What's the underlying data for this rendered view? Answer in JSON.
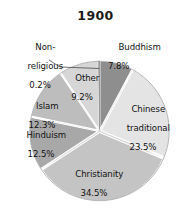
{
  "chart_data": {
    "type": "pie",
    "title": "1900",
    "subtitle": "",
    "xlabel": "",
    "ylabel": "",
    "grid": false,
    "legend_position": "none",
    "units": "percent",
    "value_suffix": "%",
    "categories": [
      "Buddhism",
      "Chinese traditional",
      "Christianity",
      "Hinduism",
      "Islam",
      "Other",
      "Non-religious"
    ],
    "values": [
      7.8,
      23.5,
      34.5,
      12.5,
      12.3,
      9.2,
      0.2
    ],
    "slices": [
      {
        "label": "Buddhism",
        "value": 7.8,
        "value_text": "7.8%",
        "color": "#8e8e8e",
        "start_deg": 0,
        "end_deg": 28.08,
        "label_placement": "outside-right"
      },
      {
        "label": "Chinese\ntraditional",
        "label_line1": "Chinese",
        "label_line2": "traditional",
        "value": 23.5,
        "value_text": "23.5%",
        "color": "#e4e4e4",
        "start_deg": 28.08,
        "end_deg": 112.68,
        "label_placement": "inside"
      },
      {
        "label": "Christianity",
        "value": 34.5,
        "value_text": "34.5%",
        "color": "#c4c4c4",
        "start_deg": 112.68,
        "end_deg": 236.88,
        "label_placement": "inside"
      },
      {
        "label": "Hinduism",
        "value": 12.5,
        "value_text": "12.5%",
        "color": "#a8a8a8",
        "start_deg": 236.88,
        "end_deg": 281.88,
        "label_placement": "inside"
      },
      {
        "label": "Islam",
        "value": 12.3,
        "value_text": "12.3%",
        "color": "#bdbdbd",
        "start_deg": 281.88,
        "end_deg": 326.16,
        "label_placement": "inside"
      },
      {
        "label": "Other",
        "value": 9.2,
        "value_text": "9.2%",
        "color": "#d6d6d6",
        "start_deg": 326.16,
        "end_deg": 359.28,
        "label_placement": "inside"
      },
      {
        "label": "Non-\nreligious",
        "label_line1": "Non-",
        "label_line2": "religious",
        "value": 0.2,
        "value_text": "0.2%",
        "color": "#9c9c9c",
        "start_deg": 359.28,
        "end_deg": 360,
        "label_placement": "outside-left-leader"
      }
    ],
    "total": 100.0,
    "colors": {
      "background": "#ffffff",
      "text": "#131313",
      "title": "#1a1a1a",
      "slice_edge": "#ffffff",
      "outline": "#8a8a8a",
      "shadow": "#d9d9d9"
    }
  }
}
